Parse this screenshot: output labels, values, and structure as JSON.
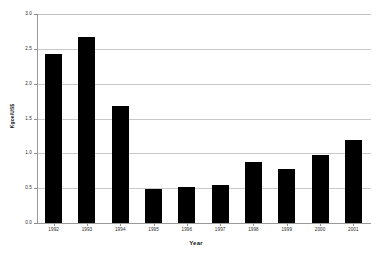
{
  "chart_data": {
    "type": "bar",
    "title": "",
    "xlabel": "Year",
    "ylabel": "Kgoe/US$",
    "categories": [
      "1992",
      "1993",
      "1994",
      "1995",
      "1996",
      "1997",
      "1998",
      "1999",
      "2000",
      "2001"
    ],
    "values": [
      2.43,
      2.67,
      1.68,
      0.49,
      0.52,
      0.54,
      0.88,
      0.77,
      0.98,
      1.19
    ],
    "ylim": [
      0.0,
      3.0
    ],
    "ytick_values": [
      0.0,
      0.5,
      1.0,
      1.5,
      2.0,
      2.5,
      3.0
    ],
    "ytick_labels": [
      "0.0",
      "0.5",
      "1.0",
      "1.5",
      "2.0",
      "2.5",
      "3.0"
    ],
    "grid": true,
    "grid_axis": "y",
    "legend": false,
    "legend_position": "none",
    "bar_color": "#000000",
    "grid_color": "#c9c9c9",
    "axis_color": "#9a9a9a",
    "background": "#ffffff"
  }
}
